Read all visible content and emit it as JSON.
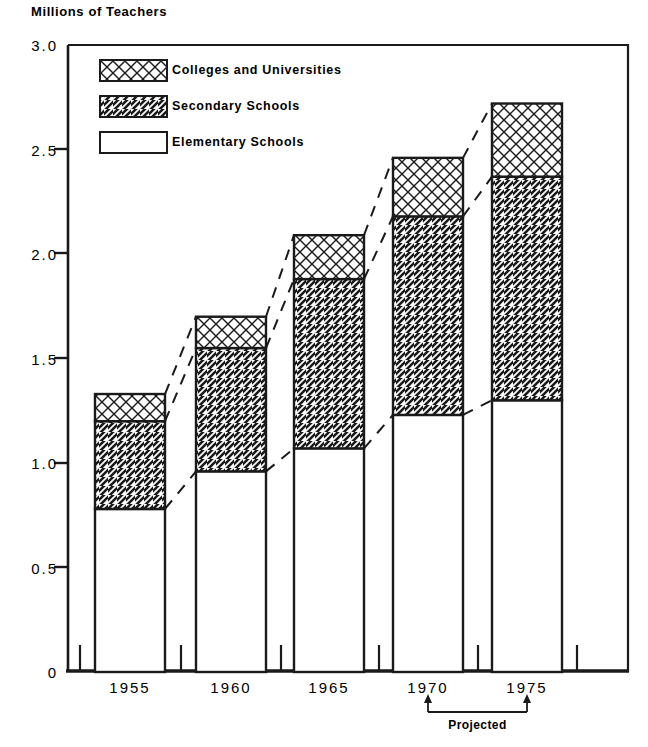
{
  "chart_data": {
    "type": "bar",
    "subtype": "stacked-bar-with-trend-connectors",
    "title": "Millions of Teachers",
    "xlabel": "",
    "ylabel": "Millions of Teachers",
    "categories": [
      "1955",
      "1960",
      "1965",
      "1970",
      "1975"
    ],
    "ylim": [
      0,
      3.0
    ],
    "ytick_values": [
      0,
      0.5,
      1.0,
      1.5,
      2.0,
      2.5,
      3.0
    ],
    "ytick_labels": [
      "0",
      "0.5",
      "1.0",
      "1.5",
      "2.0",
      "2.5",
      "3.0"
    ],
    "grid": false,
    "legend_position": "upper-left-inside",
    "series": [
      {
        "name": "Elementary Schools",
        "pattern": "blank",
        "values": [
          0.78,
          0.96,
          1.07,
          1.23,
          1.3
        ]
      },
      {
        "name": "Secondary Schools",
        "pattern": "diagonal-hatch",
        "values": [
          0.42,
          0.59,
          0.81,
          0.95,
          1.07
        ]
      },
      {
        "name": "Colleges and Universities",
        "pattern": "cross-hatch",
        "values": [
          0.13,
          0.15,
          0.21,
          0.28,
          0.35
        ]
      }
    ],
    "cumulative_tops": {
      "elementary": [
        0.78,
        0.96,
        1.07,
        1.23,
        1.3
      ],
      "secondary": [
        1.2,
        1.55,
        1.88,
        2.18,
        2.37
      ],
      "total": [
        1.33,
        1.7,
        2.09,
        2.46,
        2.72
      ]
    },
    "annotations": [
      {
        "text": "Projected",
        "span_categories": [
          "1970",
          "1975"
        ],
        "style": "bracket-with-arrows-below-axis"
      }
    ]
  },
  "legend": {
    "items": [
      {
        "label": "Colleges and Universities",
        "pattern": "cross-hatch"
      },
      {
        "label": "Secondary Schools",
        "pattern": "diagonal-hatch"
      },
      {
        "label": "Elementary Schools",
        "pattern": "blank"
      }
    ]
  },
  "annotation": {
    "projected_label": "Projected"
  }
}
